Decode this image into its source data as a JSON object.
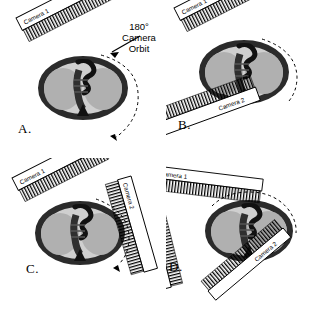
{
  "figure": {
    "background_color": "#ffffff",
    "ink_color": "#000000",
    "panels": [
      {
        "id": "A",
        "letter": "A.",
        "camera_count": 1,
        "cameras": [
          {
            "label": "Camera 1",
            "angle_deg": -27,
            "side": "upper-left"
          }
        ],
        "orbit": {
          "label_line1": "180°",
          "label_line2": "Camera",
          "label_line3": "Orbit",
          "arc_deg": 180,
          "style": "dashed",
          "arrowheads": 2
        }
      },
      {
        "id": "B",
        "letter": "B.",
        "camera_count": 2,
        "cameras": [
          {
            "label": "Camera 1",
            "angle_deg": -27,
            "side": "upper-left"
          },
          {
            "label": "Camera 2",
            "angle_deg": -20,
            "side": "lower-right"
          }
        ],
        "orbit": {
          "arc_deg": 90,
          "style": "dashed",
          "arrowheads": 0
        }
      },
      {
        "id": "C",
        "letter": "C.",
        "camera_count": 2,
        "cameras": [
          {
            "label": "Camera 1",
            "angle_deg": -27,
            "side": "upper-left"
          },
          {
            "label": "Camera 2",
            "angle_deg": 74,
            "side": "upper-right"
          }
        ],
        "orbit": {
          "arc_deg": 90,
          "style": "dashed",
          "arrowheads": 1
        }
      },
      {
        "id": "D",
        "letter": "D.",
        "camera_count": 3,
        "cameras": [
          {
            "label": "Camera 1",
            "angle_deg": 7,
            "side": "top"
          },
          {
            "label": "Camera 2",
            "angle_deg": -40,
            "side": "lower-right"
          },
          {
            "label": "Camera 3",
            "angle_deg": 76,
            "side": "left"
          }
        ],
        "orbit": {
          "arc_deg": 180,
          "style": "dashed",
          "arrowheads": 0
        }
      }
    ],
    "body_phantom": {
      "name": "thorax-cross-section",
      "outer_wall_color": "#2b2b2b",
      "lung_color": "#b0b0b0",
      "mediastinum_color": "#1a1a1a",
      "interior_color": "#cfcfcf"
    },
    "camera_body": {
      "fill_color": "#ffffff",
      "outline_color": "#000000",
      "collimator_name": "collimator-teeth"
    },
    "orbit_arc": {
      "color": "#000000",
      "dash": "3 3"
    }
  }
}
